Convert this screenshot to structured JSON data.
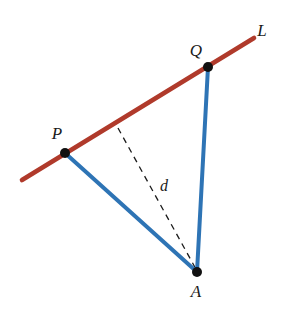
{
  "figure": {
    "type": "geometry-diagram",
    "width": 290,
    "height": 313,
    "background_color": "#ffffff"
  },
  "colors": {
    "line_red": "#b03a2b",
    "segment_blue": "#2e74b5",
    "dashed_black": "#1a1a1a",
    "point_black": "#111111",
    "label_text": "#1a1a1a"
  },
  "points": [
    {
      "id": "P",
      "label": "P",
      "x": 65,
      "y": 153,
      "label_x": 57,
      "label_y": 133,
      "radius": 5
    },
    {
      "id": "Q",
      "label": "Q",
      "x": 208,
      "y": 67,
      "label_x": 196,
      "label_y": 50,
      "radius": 5
    },
    {
      "id": "A",
      "label": "A",
      "x": 197,
      "y": 272,
      "label_x": 196,
      "label_y": 291,
      "radius": 5
    }
  ],
  "lines": [
    {
      "id": "L",
      "name": "line-L",
      "label": "L",
      "label_x": 262,
      "label_y": 30,
      "x1": 22,
      "y1": 180,
      "x2": 254,
      "y2": 38,
      "color": "#b03a2b",
      "width": 4.6,
      "style": "solid"
    },
    {
      "id": "PA",
      "name": "segment-P-A",
      "label": "",
      "x1": 65,
      "y1": 153,
      "x2": 197,
      "y2": 272,
      "color": "#2e74b5",
      "width": 4.0,
      "style": "solid"
    },
    {
      "id": "QA",
      "name": "segment-Q-A",
      "label": "",
      "x1": 208,
      "y1": 67,
      "x2": 197,
      "y2": 272,
      "color": "#2e74b5",
      "width": 4.0,
      "style": "solid"
    },
    {
      "id": "d",
      "name": "segment-distance-d",
      "label": "d",
      "label_x": 164,
      "label_y": 186,
      "x1": 118,
      "y1": 128,
      "x2": 197,
      "y2": 271,
      "color": "#1a1a1a",
      "width": 1.3,
      "style": "dashed",
      "dash_pattern": "6 5"
    }
  ],
  "labels": {
    "line_L": "L",
    "point_P": "P",
    "point_Q": "Q",
    "point_A": "A",
    "distance_d": "d"
  }
}
